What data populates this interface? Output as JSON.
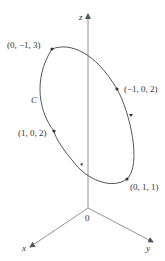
{
  "diagram": {
    "axes": {
      "z_label": "z",
      "x_label": "x",
      "y_label": "y",
      "origin_label": "0"
    },
    "curve_label": "C",
    "points": [
      {
        "label": "(0, −1, 3)"
      },
      {
        "label": "(−1, 0, 2)"
      },
      {
        "label": "(0, 1, 1)"
      },
      {
        "label": "(1, 0, 2)"
      }
    ],
    "colors": {
      "curve": "#555555",
      "axis": "#777777",
      "text": "#333333"
    }
  }
}
